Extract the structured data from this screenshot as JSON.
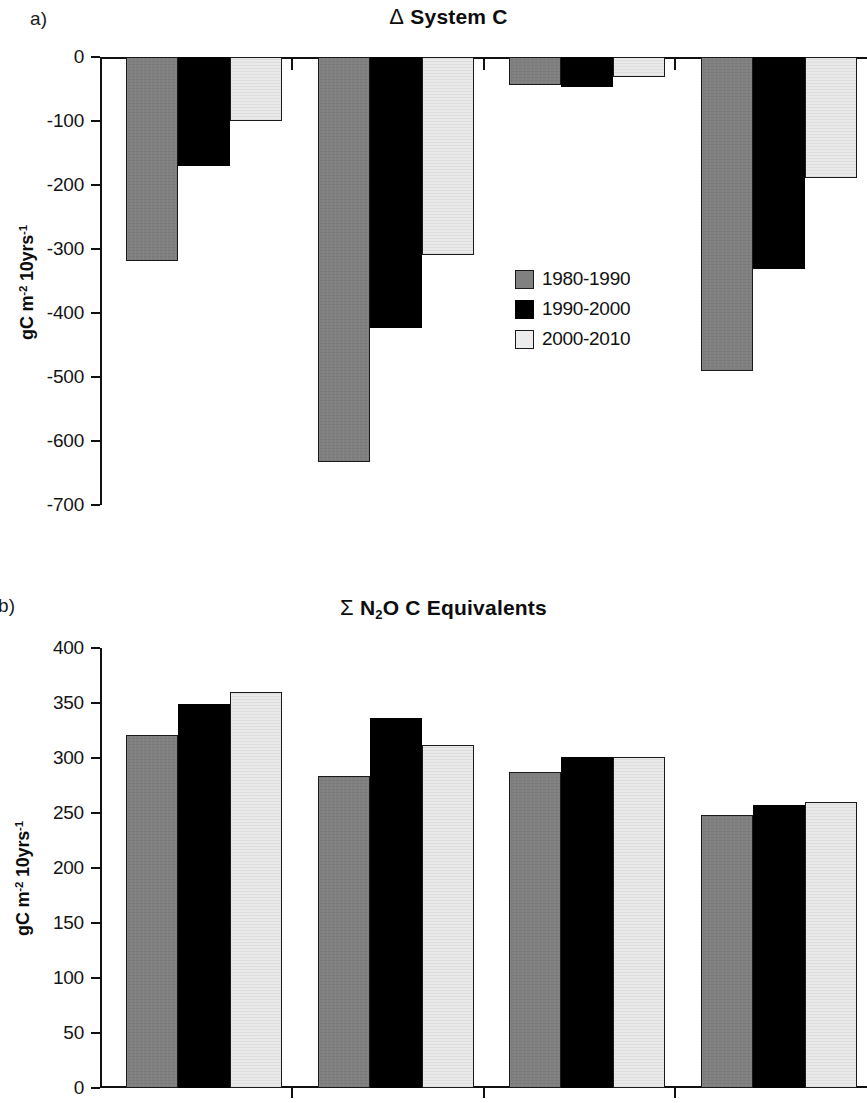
{
  "figure": {
    "panel_a_letter": "a)",
    "panel_b_letter": "b)"
  },
  "legend": {
    "items": [
      {
        "label": "1980-1990",
        "color": "#808080"
      },
      {
        "label": "1990-2000",
        "color": "#000000"
      },
      {
        "label": "2000-2010",
        "color": "#ececec"
      }
    ]
  },
  "axis_label_text": {
    "unit_main": "gC m",
    "unit_sup1": "-2",
    "unit_mid": " 10yrs",
    "unit_sup2": "-1"
  },
  "chart_data": [
    {
      "type": "bar",
      "panel": "a",
      "title": "Δ System  C",
      "title_symbol": "Δ",
      "title_rest": "System  C",
      "xlabel": "",
      "ylabel": "gC m-2 10yrs-1",
      "ylim": [
        -700,
        0
      ],
      "yticks": [
        0,
        -100,
        -200,
        -300,
        -400,
        -500,
        -600,
        -700
      ],
      "ytick_labels": [
        "0",
        "-100",
        "-200",
        "-300",
        "-400",
        "-500",
        "-600",
        "-700"
      ],
      "grid": false,
      "legend_position": "center-right",
      "categories": [
        "1",
        "2",
        "3",
        "4"
      ],
      "series": [
        {
          "name": "1980-1990",
          "color": "#808080",
          "values": [
            -318,
            -633,
            -43,
            -490
          ]
        },
        {
          "name": "1990-2000",
          "color": "#000000",
          "values": [
            -170,
            -424,
            -47,
            -331
          ]
        },
        {
          "name": "2000-2010",
          "color": "#ececec",
          "values": [
            -100,
            -309,
            -31,
            -189
          ]
        }
      ]
    },
    {
      "type": "bar",
      "panel": "b",
      "title": "Σ N2O C Equivalents",
      "title_symbol": "Σ",
      "title_rest": "N2O C Equivalents",
      "xlabel": "",
      "ylabel": "gC m-2 10yrs-1",
      "ylim": [
        0,
        400
      ],
      "yticks": [
        400,
        350,
        300,
        250,
        200,
        150,
        100,
        50,
        0
      ],
      "ytick_labels": [
        "400",
        "350",
        "300",
        "250",
        "200",
        "150",
        "100",
        "50",
        "0"
      ],
      "grid": false,
      "legend_position": "none",
      "categories": [
        "1",
        "2",
        "3",
        "4"
      ],
      "series": [
        {
          "name": "1980-1990",
          "color": "#808080",
          "values": [
            321,
            284,
            287,
            248
          ]
        },
        {
          "name": "1990-2000",
          "color": "#000000",
          "values": [
            349,
            336,
            301,
            257
          ]
        },
        {
          "name": "2000-2010",
          "color": "#ececec",
          "values": [
            360,
            312,
            301,
            260
          ]
        }
      ]
    }
  ]
}
